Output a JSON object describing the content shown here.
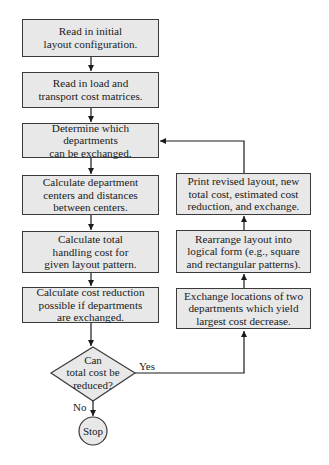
{
  "flowchart": {
    "left_column": [
      {
        "id": "read-layout",
        "text": "Read in initial\nlayout configuration."
      },
      {
        "id": "read-matrices",
        "text": "Read in load and\ntransport cost matrices."
      },
      {
        "id": "determine-exchange",
        "text": "Determine which departments\ncan be exchanged."
      },
      {
        "id": "calc-centers",
        "text": "Calculate department\ncenters and distances\nbetween centers."
      },
      {
        "id": "calc-total-cost",
        "text": "Calculate total\nhandling cost for\ngiven layout pattern."
      },
      {
        "id": "calc-reduction",
        "text": "Calculate cost reduction\npossible if departments\nare exchanged."
      }
    ],
    "right_column": [
      {
        "id": "print-revised",
        "text": "Print revised layout, new\ntotal cost, estimated cost\nreduction, and exchange."
      },
      {
        "id": "rearrange",
        "text": "Rearrange layout into\nlogical form (e.g., square\nand rectangular patterns)."
      },
      {
        "id": "exchange-locations",
        "text": "Exchange locations of two\ndepartments which yield\nlargest cost decrease."
      }
    ],
    "decision": {
      "text": "Can\ntotal cost be\nreduced?",
      "yes_label": "Yes",
      "no_label": "No"
    },
    "terminal": {
      "text": "Stop"
    }
  },
  "colors": {
    "box_fill": "#e8e8e8",
    "stroke": "#3a3a3a",
    "background": "#ffffff"
  }
}
